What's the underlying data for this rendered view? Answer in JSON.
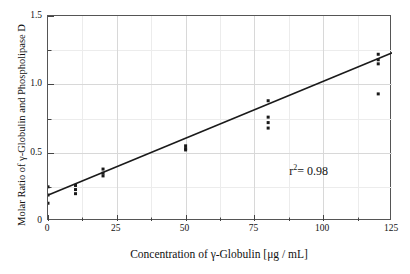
{
  "chart_data": {
    "type": "scatter",
    "title": "",
    "xlabel": "Concentration of γ-Globulin [μg / mL]",
    "ylabel": "Molar Ratio of γ-Globulin and Phospholipase D",
    "xlim": [
      0,
      125
    ],
    "ylim": [
      0,
      1.5
    ],
    "xticks": [
      0,
      25,
      50,
      75,
      100,
      125
    ],
    "xticklabels": [
      "0",
      "25",
      "50",
      "75",
      "100",
      "125"
    ],
    "yticks": [
      0,
      0.5,
      1.0,
      1.5
    ],
    "yticklabels": [
      "0",
      "0.5",
      "1.0",
      "1.5"
    ],
    "x_minor_ticks": [
      12.5,
      37.5,
      62.5,
      87.5,
      112.5
    ],
    "y_minor_ticks": [
      0.25,
      0.75,
      1.25
    ],
    "grid": true,
    "grid_color": "#d8d8d8",
    "marker": "square",
    "marker_color": "#1a1a1a",
    "marker_size": 3,
    "series": [
      {
        "name": "measurements",
        "points": [
          {
            "x": 0,
            "y": 0.25
          },
          {
            "x": 0,
            "y": 0.19
          },
          {
            "x": 0,
            "y": 0.13
          },
          {
            "x": 10,
            "y": 0.26
          },
          {
            "x": 10,
            "y": 0.23
          },
          {
            "x": 10,
            "y": 0.2
          },
          {
            "x": 20,
            "y": 0.38
          },
          {
            "x": 20,
            "y": 0.35
          },
          {
            "x": 20,
            "y": 0.33
          },
          {
            "x": 50,
            "y": 0.55
          },
          {
            "x": 50,
            "y": 0.53
          },
          {
            "x": 50,
            "y": 0.52
          },
          {
            "x": 80,
            "y": 0.88
          },
          {
            "x": 80,
            "y": 0.76
          },
          {
            "x": 80,
            "y": 0.72
          },
          {
            "x": 80,
            "y": 0.68
          },
          {
            "x": 120,
            "y": 1.22
          },
          {
            "x": 120,
            "y": 1.18
          },
          {
            "x": 120,
            "y": 1.15
          },
          {
            "x": 120,
            "y": 0.93
          }
        ]
      }
    ],
    "fit_line": {
      "name": "linear regression",
      "x_start": 0,
      "y_start": 0.19,
      "x_end": 125,
      "y_end": 1.23,
      "color": "#1a1a1a",
      "width": 1.6
    },
    "annotations": [
      {
        "name": "r-squared",
        "text_prefix": "r",
        "text_sup": "2",
        "text_suffix": "= 0.98",
        "x": 88,
        "y": 0.355
      }
    ]
  }
}
